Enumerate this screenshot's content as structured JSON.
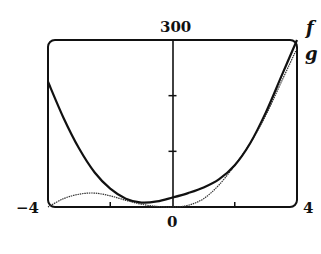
{
  "chart_data": {
    "type": "line",
    "title": "",
    "xlabel": "",
    "ylabel": "",
    "xlim": [
      -4,
      4
    ],
    "ylim": [
      0,
      300
    ],
    "x_tick_labels": [
      "-4",
      "0",
      "4"
    ],
    "y_tick_labels": [
      "300"
    ],
    "x_minor_ticks": [
      -2,
      2
    ],
    "y_minor_ticks": [
      100,
      200
    ],
    "grid": false,
    "legend": {
      "position": "right-of-plot-top",
      "entries": [
        "f",
        "g"
      ]
    },
    "series": [
      {
        "name": "f",
        "style": "thick",
        "x": [
          -4,
          -3.5,
          -3,
          -2.5,
          -2,
          -1.5,
          -1,
          -0.5,
          0,
          0.5,
          1,
          1.5,
          2,
          2.5,
          3,
          3.5,
          4
        ],
        "values": [
          225,
          160,
          105,
          62,
          33,
          15,
          8,
          10,
          17,
          25,
          35,
          50,
          75,
          115,
          170,
          235,
          300
        ]
      },
      {
        "name": "g",
        "style": "thin",
        "x": [
          -4,
          -3.5,
          -3,
          -2.5,
          -2,
          -1.5,
          -1,
          -0.5,
          0,
          0.5,
          1,
          1.5,
          2,
          2.5,
          3,
          3.5,
          4
        ],
        "values": [
          0,
          15,
          23,
          25,
          20,
          12,
          5,
          1,
          0,
          3,
          15,
          40,
          75,
          115,
          165,
          225,
          285
        ]
      }
    ]
  },
  "labels": {
    "y_top": "300",
    "x_left": "−4",
    "x_mid": "0",
    "x_right": "4",
    "legend_f": "f",
    "legend_g": "g"
  }
}
